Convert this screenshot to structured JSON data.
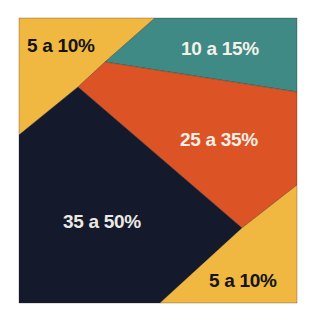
{
  "chart_data": {
    "type": "area",
    "title": "",
    "legend": [],
    "segments": [
      {
        "id": "yellow-top-left",
        "label": "5 a 10%",
        "color": "#f0b840",
        "text_color": "#15130f",
        "points": "19,18 155,18 105,62 78,87 19,135",
        "label_x": 27,
        "label_y": 52
      },
      {
        "id": "teal",
        "label": "10 a 15%",
        "color": "#3f8a84",
        "text_color": "#f4f1ea",
        "points": "155,18 297,18 297,92 105,62",
        "label_x": 181,
        "label_y": 55
      },
      {
        "id": "orange",
        "label": "25 a 35%",
        "color": "#dc5426",
        "text_color": "#f7efe6",
        "points": "105,62 297,92 297,185 242,228 78,87",
        "label_x": 180,
        "label_y": 146
      },
      {
        "id": "navy",
        "label": "35 a 50%",
        "color": "#141a2c",
        "text_color": "#ece9e4",
        "points": "19,135 78,87 242,228 160,303 19,303",
        "label_x": 63,
        "label_y": 228
      },
      {
        "id": "yellow-bottom-right",
        "label": "5 a 10%",
        "color": "#f0b840",
        "text_color": "#15130f",
        "points": "242,228 297,185 297,303 160,303",
        "label_x": 209,
        "label_y": 287
      }
    ],
    "categories": [
      "5 a 10%",
      "10 a 15%",
      "25 a 35%",
      "35 a 50%",
      "5 a 10%"
    ],
    "ranges": [
      [
        5,
        10
      ],
      [
        10,
        15
      ],
      [
        25,
        35
      ],
      [
        35,
        50
      ],
      [
        5,
        10
      ]
    ]
  },
  "labels": {
    "yellow_top_left": "5 a 10%",
    "teal": "10 a 15%",
    "orange": "25 a 35%",
    "navy": "35 a 50%",
    "yellow_bottom_right": "5 a 10%"
  }
}
